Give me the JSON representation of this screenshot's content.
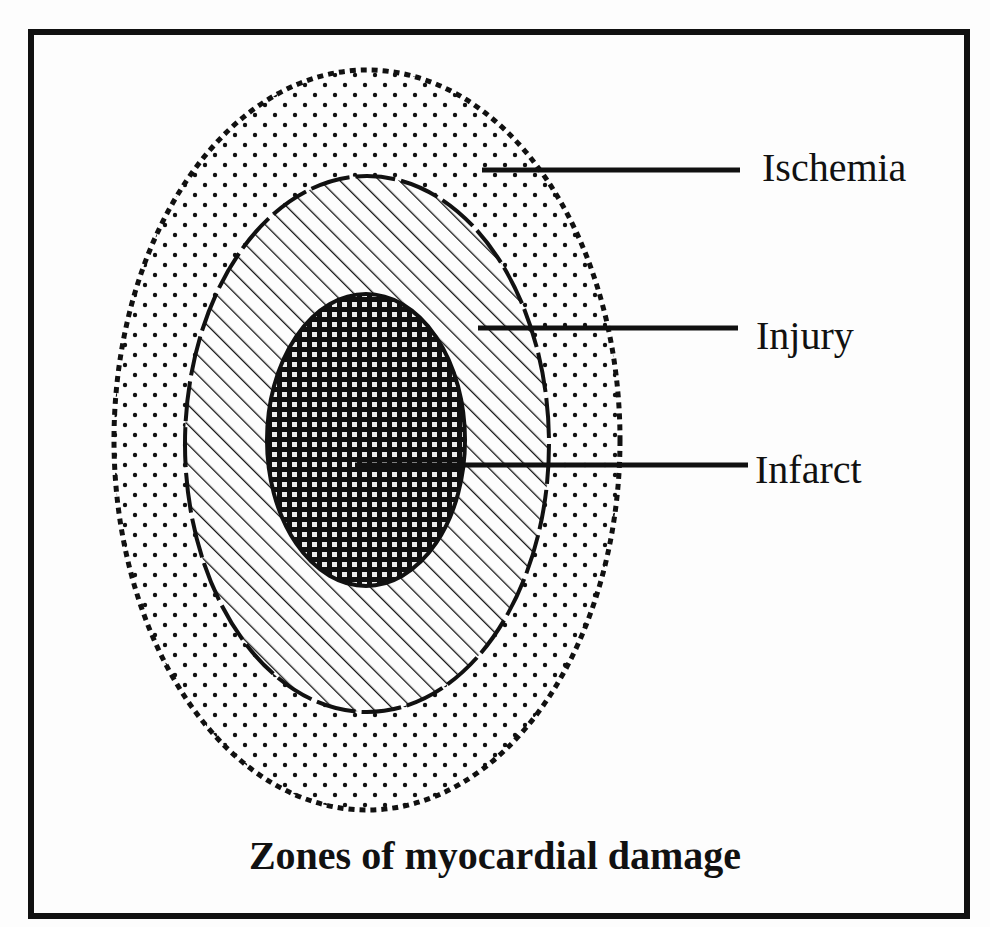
{
  "diagram": {
    "title": "Zones of myocardial damage",
    "zones": [
      {
        "name": "Ischemia",
        "label": "Ischemia",
        "pattern": "dots",
        "border": "dotted"
      },
      {
        "name": "Injury",
        "label": "Injury",
        "pattern": "diagonal-hatch",
        "border": "dashed"
      },
      {
        "name": "Infarct",
        "label": "Infarct",
        "pattern": "dense-checker",
        "border": "solid"
      }
    ],
    "colors": {
      "ink": "#111111",
      "paper": "#fdfdfd"
    }
  }
}
